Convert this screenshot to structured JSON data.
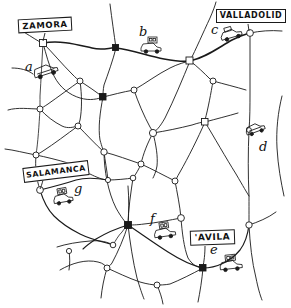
{
  "map": {
    "title": "Hand-drawn road network map",
    "width": 291,
    "height": 308,
    "style": "hand-drawn pen sketch",
    "ink_color": "#1a1a1a",
    "paper_color": "#ffffff"
  },
  "cities": [
    {
      "id": "zamora",
      "name": "ZAMORA",
      "label_x": 18,
      "label_y": 18,
      "label_w": 54,
      "label_h": 14,
      "rotation": -3,
      "font_size": 8.5,
      "node_x": 43,
      "node_y": 43,
      "node_shape": "square"
    },
    {
      "id": "valladolid",
      "name": "VALLADOLID",
      "label_x": 216,
      "label_y": 9,
      "label_w": 70,
      "label_h": 14,
      "rotation": 0,
      "font_size": 8.5,
      "node_x": 250,
      "node_y": 33,
      "node_shape": "circle"
    },
    {
      "id": "salamanca",
      "name": "SALAMANCA",
      "label_x": 23,
      "label_y": 164,
      "label_w": 65,
      "label_h": 15,
      "rotation": -7,
      "font_size": 8,
      "node_x": 40,
      "node_y": 190,
      "node_shape": "circle"
    },
    {
      "id": "avila",
      "name": "'AVILA",
      "label_x": 190,
      "label_y": 230,
      "label_w": 44,
      "label_h": 15,
      "rotation": -2,
      "font_size": 9,
      "node_x": 203,
      "node_y": 268,
      "node_shape": "square"
    }
  ],
  "markers": [
    {
      "id": "a",
      "letter": "a",
      "x": 27,
      "y": 66,
      "font_size": 12,
      "vehicles": 1,
      "vehicle_x": 38,
      "vehicle_y": 74,
      "vehicle_kind": "car"
    },
    {
      "id": "b",
      "letter": "b",
      "x": 140,
      "y": 30,
      "font_size": 12,
      "vehicles": 2,
      "vehicle_x": 146,
      "vehicle_y": 43,
      "vehicle_kind": "truck-stack"
    },
    {
      "id": "c",
      "letter": "c",
      "x": 212,
      "y": 28,
      "font_size": 12,
      "vehicles": 2,
      "vehicle_x": 221,
      "vehicle_y": 36,
      "vehicle_kind": "car-pair"
    },
    {
      "id": "d",
      "letter": "d",
      "x": 260,
      "y": 145,
      "font_size": 12,
      "vehicles": 1,
      "vehicle_x": 248,
      "vehicle_y": 131,
      "vehicle_kind": "car"
    },
    {
      "id": "e",
      "letter": "e",
      "x": 214,
      "y": 249,
      "font_size": 12,
      "vehicles": 2,
      "vehicle_x": 222,
      "vehicle_y": 262,
      "vehicle_kind": "truck-stack"
    },
    {
      "id": "f",
      "letter": "f",
      "x": 152,
      "y": 219,
      "font_size": 12,
      "vehicles": 2,
      "vehicle_x": 157,
      "vehicle_y": 229,
      "vehicle_kind": "truck-stack"
    },
    {
      "id": "g",
      "letter": "g",
      "x": 75,
      "y": 189,
      "font_size": 12,
      "vehicles": 2,
      "vehicle_x": 55,
      "vehicle_y": 195,
      "vehicle_kind": "truck-stack"
    }
  ],
  "nodes": [
    {
      "x": 43,
      "y": 43,
      "shape": "square"
    },
    {
      "x": 116,
      "y": 48,
      "shape": "dot"
    },
    {
      "x": 190,
      "y": 61,
      "shape": "square"
    },
    {
      "x": 250,
      "y": 33,
      "shape": "circle"
    },
    {
      "x": 80,
      "y": 81,
      "shape": "circle"
    },
    {
      "x": 134,
      "y": 90,
      "shape": "circle"
    },
    {
      "x": 103,
      "y": 97,
      "shape": "square"
    },
    {
      "x": 213,
      "y": 81,
      "shape": "circle"
    },
    {
      "x": 40,
      "y": 109,
      "shape": "circle"
    },
    {
      "x": 78,
      "y": 126,
      "shape": "circle"
    },
    {
      "x": 153,
      "y": 133,
      "shape": "circle"
    },
    {
      "x": 205,
      "y": 122,
      "shape": "square"
    },
    {
      "x": 36,
      "y": 155,
      "shape": "circle"
    },
    {
      "x": 104,
      "y": 152,
      "shape": "circle"
    },
    {
      "x": 40,
      "y": 190,
      "shape": "circle"
    },
    {
      "x": 141,
      "y": 164,
      "shape": "circle"
    },
    {
      "x": 133,
      "y": 178,
      "shape": "circle"
    },
    {
      "x": 108,
      "y": 180,
      "shape": "circle"
    },
    {
      "x": 175,
      "y": 181,
      "shape": "circle"
    },
    {
      "x": 181,
      "y": 218,
      "shape": "circle"
    },
    {
      "x": 128,
      "y": 225,
      "shape": "square"
    },
    {
      "x": 69,
      "y": 235,
      "shape": "circle"
    },
    {
      "x": 113,
      "y": 245,
      "shape": "circle"
    },
    {
      "x": 203,
      "y": 268,
      "shape": "square"
    },
    {
      "x": 249,
      "y": 225,
      "shape": "circle"
    },
    {
      "x": 107,
      "y": 268,
      "shape": "circle"
    },
    {
      "x": 157,
      "y": 285,
      "shape": "circle"
    },
    {
      "x": 69,
      "y": 251,
      "shape": "circle"
    }
  ],
  "legend": {
    "letters": [
      "a",
      "b",
      "c",
      "d",
      "e",
      "f",
      "g"
    ],
    "note": "Lettered positions marked with vehicle symbols along the road network"
  }
}
